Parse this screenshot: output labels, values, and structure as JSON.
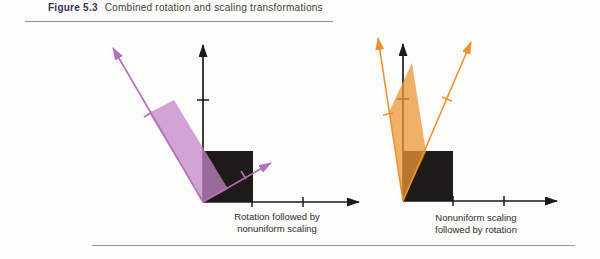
{
  "header": {
    "figure_label": "Figure 5.3",
    "title": "Combined rotation and scaling transformations"
  },
  "left_diagram": {
    "caption_line1": "Rotation followed by",
    "caption_line2": "nonuniform scaling"
  },
  "right_diagram": {
    "caption_line1": "Nonuniform scaling",
    "caption_line2": "followed by rotation"
  },
  "colors": {
    "figure_label_text": "#43305c",
    "title_text": "#3c3c3c",
    "axis": "#1c1a19",
    "square": "#1d1a18",
    "pink_shape": "#c487c6",
    "purple_arrow": "#b470bb",
    "orange_shape": "#ec9736",
    "orange_arrow": "#ed9232",
    "rule": "#919191"
  }
}
